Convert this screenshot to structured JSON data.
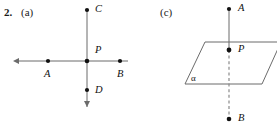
{
  "exercise": {
    "number": "2.",
    "parts": [
      {
        "key": "a",
        "label": "(a)"
      },
      {
        "key": "c",
        "label": "(c)"
      }
    ]
  },
  "figure_a": {
    "caption": "(a)",
    "description": "Two intersecting lines in a plane meeting at point P",
    "points": [
      {
        "name": "C",
        "label": "C",
        "x": 87,
        "y": 10
      },
      {
        "name": "P",
        "label": "P",
        "x": 87,
        "y": 61
      },
      {
        "name": "A",
        "label": "A",
        "x": 48,
        "y": 61
      },
      {
        "name": "B",
        "label": "B",
        "x": 120,
        "y": 61
      },
      {
        "name": "D",
        "label": "D",
        "x": 87,
        "y": 90
      }
    ],
    "lines": [
      {
        "name": "horizontal-line",
        "from": [
          19,
          61
        ],
        "to": [
          128,
          61
        ],
        "arrow_start": true,
        "arrow_end": false,
        "style": "solid"
      },
      {
        "name": "vertical-line",
        "from": [
          87,
          10
        ],
        "to": [
          87,
          108
        ],
        "arrow_start": false,
        "arrow_end": true,
        "style": "solid"
      }
    ],
    "stroke_color": "#6b6b6b",
    "point_color": "#111111"
  },
  "figure_c": {
    "caption": "(c)",
    "description": "A line AB piercing plane alpha at point P",
    "plane": {
      "name": "alpha",
      "label": "α",
      "label_x": 191,
      "label_y": 74,
      "corners": [
        [
          205,
          42
        ],
        [
          281,
          42
        ],
        [
          262,
          84
        ],
        [
          185,
          84
        ]
      ],
      "stroke_color": "#6b6b6b"
    },
    "points": [
      {
        "name": "A",
        "label": "A",
        "x": 229,
        "y": 9
      },
      {
        "name": "P",
        "label": "P",
        "x": 229,
        "y": 50
      },
      {
        "name": "B",
        "label": "B",
        "x": 229,
        "y": 119
      }
    ],
    "segments": [
      {
        "name": "segment-AP",
        "from": [
          229,
          9
        ],
        "to": [
          229,
          50
        ],
        "style": "solid"
      },
      {
        "name": "segment-PB",
        "from": [
          229,
          50
        ],
        "to": [
          229,
          119
        ],
        "style": "dashed"
      }
    ],
    "stroke_color": "#6b6b6b",
    "point_color": "#111111"
  },
  "colors": {
    "background": "#ffffff",
    "ink": "#1a1a1a",
    "line": "#6b6b6b",
    "dot": "#111111"
  }
}
